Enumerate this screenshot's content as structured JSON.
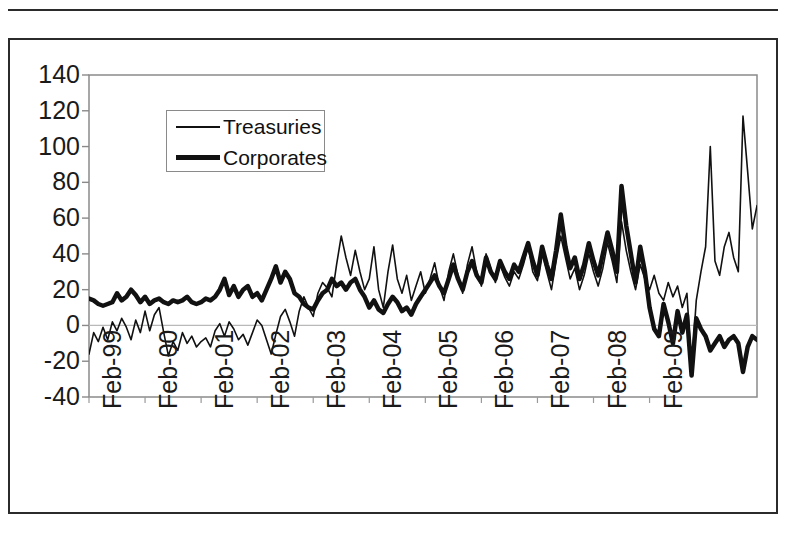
{
  "chart_data": {
    "type": "line",
    "title": "",
    "subtitle": "",
    "xlabel": "",
    "ylabel": "",
    "ylim": [
      -40,
      140
    ],
    "yticks": [
      -40,
      -20,
      0,
      20,
      40,
      60,
      80,
      100,
      120,
      140
    ],
    "ytick_labels": [
      "-40",
      "-20",
      "0",
      "20",
      "40",
      "60",
      "80",
      "100",
      "120",
      "140"
    ],
    "xtick_labels": [
      "Feb-99",
      "Feb-00",
      "Feb-01",
      "Feb-02",
      "Feb-03",
      "Feb-04",
      "Feb-05",
      "Feb-06",
      "Feb-07",
      "Feb-08",
      "Feb-09"
    ],
    "x_start": "Feb-99",
    "x_end": "Feb-10",
    "x_frequency": "monthly",
    "grid": "zero-line-only",
    "legend_position": "upper-left-inside",
    "annotations": [],
    "series": [
      {
        "name": "Treasuries",
        "style": "thin",
        "color": "#111111",
        "line_width": 1.6,
        "values": [
          -16,
          -4,
          -9,
          -1,
          -8,
          2,
          -3,
          4,
          -1,
          -8,
          3,
          -4,
          8,
          -3,
          6,
          10,
          -4,
          -17,
          -9,
          -14,
          -4,
          -10,
          -6,
          -12,
          -9,
          -7,
          -12,
          -3,
          1,
          -6,
          2,
          -2,
          -8,
          -5,
          -11,
          -4,
          3,
          0,
          -8,
          -16,
          -5,
          5,
          9,
          2,
          -6,
          8,
          16,
          10,
          5,
          18,
          24,
          21,
          16,
          34,
          50,
          38,
          28,
          42,
          30,
          20,
          26,
          44,
          20,
          10,
          30,
          45,
          26,
          18,
          28,
          14,
          22,
          30,
          18,
          26,
          35,
          22,
          14,
          30,
          40,
          28,
          18,
          34,
          44,
          30,
          22,
          40,
          32,
          24,
          34,
          27,
          22,
          30,
          26,
          34,
          44,
          30,
          25,
          40,
          30,
          20,
          36,
          50,
          38,
          26,
          32,
          20,
          28,
          40,
          30,
          22,
          32,
          46,
          36,
          24,
          58,
          42,
          30,
          20,
          34,
          26,
          20,
          28,
          18,
          14,
          24,
          16,
          22,
          10,
          18,
          -24,
          14,
          30,
          44,
          100,
          36,
          28,
          44,
          52,
          38,
          30,
          117,
          86,
          54,
          67
        ]
      },
      {
        "name": "Corporates",
        "style": "thick",
        "color": "#111111",
        "line_width": 4.5,
        "values": [
          15,
          14,
          12,
          11,
          12,
          13,
          18,
          14,
          16,
          20,
          17,
          13,
          16,
          12,
          14,
          15,
          13,
          12,
          14,
          13,
          14,
          16,
          13,
          12,
          13,
          15,
          14,
          16,
          20,
          26,
          17,
          22,
          16,
          20,
          22,
          16,
          18,
          14,
          20,
          26,
          33,
          24,
          30,
          26,
          18,
          16,
          12,
          10,
          9,
          14,
          18,
          20,
          26,
          22,
          24,
          20,
          24,
          26,
          20,
          16,
          10,
          14,
          9,
          7,
          12,
          16,
          13,
          8,
          10,
          6,
          12,
          16,
          20,
          24,
          28,
          22,
          18,
          26,
          34,
          26,
          20,
          30,
          36,
          28,
          24,
          38,
          30,
          26,
          36,
          30,
          26,
          34,
          30,
          38,
          46,
          36,
          28,
          44,
          34,
          26,
          42,
          62,
          44,
          32,
          38,
          26,
          34,
          46,
          36,
          28,
          40,
          52,
          42,
          30,
          78,
          56,
          40,
          24,
          44,
          30,
          10,
          -2,
          -6,
          12,
          2,
          -10,
          8,
          -4,
          6,
          -28,
          4,
          -2,
          -6,
          -14,
          -10,
          -6,
          -12,
          -8,
          -6,
          -10,
          -26,
          -12,
          -6,
          -8
        ]
      }
    ]
  },
  "legend": {
    "items": [
      {
        "label": "Treasuries",
        "style": "thin"
      },
      {
        "label": "Corporates",
        "style": "thick"
      }
    ]
  },
  "colors": {
    "line": "#111111",
    "frame": "#2b2b2b",
    "axis": "#8a8a8a",
    "text": "#1a1a1a"
  }
}
